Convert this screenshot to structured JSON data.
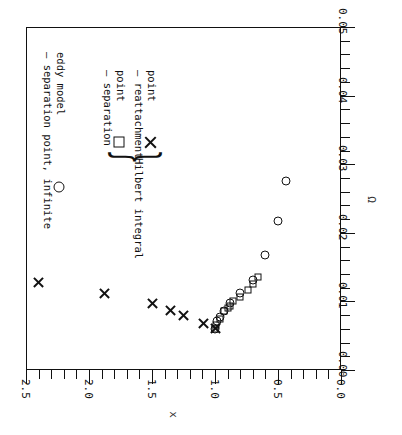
{
  "chart_data": {
    "type": "scatter",
    "title": "",
    "xlabel": "Ω",
    "ylabel": "x",
    "xlim": [
      0.0,
      0.05
    ],
    "ylim": [
      0.0,
      2.5
    ],
    "grid": false,
    "orientation": "rotated-90",
    "xticks": [
      "0.00",
      "0.01",
      "0.02",
      "0.03",
      "0.04",
      "0.05"
    ],
    "xtick_values": [
      0.0,
      0.01,
      0.02,
      0.03,
      0.04,
      0.05
    ],
    "xminor_step": 0.002,
    "yticks": [
      "0.0",
      "0.5",
      "1.0",
      "1.5",
      "2.0",
      "2.5"
    ],
    "ytick_values": [
      0.0,
      0.5,
      1.0,
      1.5,
      2.0,
      2.5
    ],
    "yminor_step": 0.1,
    "legend_position": "upper-left",
    "series": [
      {
        "name": "separation point, eddy model",
        "marker": "circle",
        "points": [
          [
            0.006,
            1.0
          ],
          [
            0.0071,
            0.985
          ],
          [
            0.0078,
            0.96
          ],
          [
            0.0086,
            0.93
          ],
          [
            0.0098,
            0.88
          ],
          [
            0.0112,
            0.8
          ],
          [
            0.0131,
            0.7
          ],
          [
            0.0168,
            0.6
          ],
          [
            0.0218,
            0.5
          ],
          [
            0.0276,
            0.44
          ]
        ]
      },
      {
        "name": "separation point",
        "group": "Hilbert integral",
        "marker": "square",
        "points": [
          [
            0.006,
            1.0
          ],
          [
            0.0066,
            0.995
          ],
          [
            0.0075,
            0.96
          ],
          [
            0.0086,
            0.93
          ],
          [
            0.0091,
            0.9
          ],
          [
            0.0094,
            0.885
          ],
          [
            0.01,
            0.86
          ],
          [
            0.0107,
            0.8
          ],
          [
            0.0117,
            0.74
          ],
          [
            0.0126,
            0.7
          ],
          [
            0.0135,
            0.66
          ]
        ]
      },
      {
        "name": "reattachment point",
        "group": "Hilbert integral",
        "marker": "x",
        "points": [
          [
            0.006,
            1.0
          ],
          [
            0.0068,
            1.09
          ],
          [
            0.008,
            1.25
          ],
          [
            0.0087,
            1.35
          ],
          [
            0.0097,
            1.5
          ],
          [
            0.0112,
            1.88
          ],
          [
            0.0127,
            2.4
          ]
        ]
      }
    ],
    "annotations": [
      {
        "text": "– separation point, infinite\n  eddy model",
        "marker": "circle"
      },
      {
        "text": "– separation\n  point",
        "marker": "square"
      },
      {
        "text": "– reattachment\n  point",
        "marker": "x"
      },
      {
        "text": "Hilbert integral",
        "marker": "brace"
      }
    ]
  },
  "legend": {
    "circle_line1": "– separation point, infinite",
    "circle_line2": "eddy model",
    "square_line1": "– separation",
    "square_line2": "point",
    "x_line1": "– reattachment",
    "x_line2": "point",
    "brace_label": "Hilbert integral",
    "brace_glyph": "}"
  },
  "axes": {
    "x_title": "Ω",
    "y_title": "x",
    "x_labels": [
      "0.00",
      "0.01",
      "0.02",
      "0.03",
      "0.04",
      "0.05"
    ],
    "y_labels": [
      "2.5",
      "2.0",
      "1.5",
      "1.0",
      "0.5",
      "0.0"
    ]
  }
}
